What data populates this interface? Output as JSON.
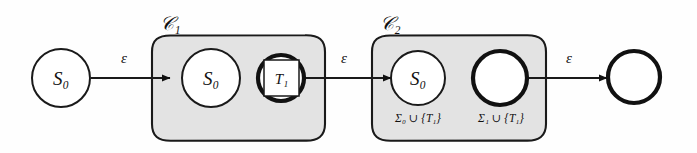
{
  "diagram": {
    "background_color": "#fefefe",
    "group_fill_color": "#e3e3e3",
    "stroke_color": "#1a1a1a",
    "groups": [
      {
        "id": "C1",
        "label": "‒1",
        "label_script": "C",
        "label_text": "C₁"
      },
      {
        "id": "C2",
        "label": "‒2",
        "label_script": "C",
        "label_text": "C₂"
      }
    ],
    "group_labels": {
      "c1": "𝒞₁",
      "c2": "𝒞₂"
    },
    "nodes": [
      {
        "id": "n0",
        "label": "S₀",
        "style": "thin-circle",
        "group": null
      },
      {
        "id": "n1",
        "label": "S₀",
        "style": "thin-circle",
        "group": "C1"
      },
      {
        "id": "n2",
        "label": "T₁",
        "style": "thick-circle-with-square",
        "group": "C1"
      },
      {
        "id": "n3",
        "label": "S₀",
        "style": "thin-circle",
        "group": "C2"
      },
      {
        "id": "n4",
        "label": "",
        "style": "thick-circle",
        "group": "C2"
      },
      {
        "id": "n5",
        "label": "",
        "style": "thick-circle",
        "group": null
      }
    ],
    "node_labels": {
      "start_s0": "S₀",
      "c1_s0": "S₀",
      "c1_t1": "T₁",
      "c2_s0": "S₀",
      "c2_blank": "",
      "final_blank": ""
    },
    "alphabet_labels": {
      "sigma0": "Σ₀ ∪ {T₁}",
      "sigma1": "Σ₁ ∪ {T₁}"
    },
    "edges": [
      {
        "id": "e1",
        "from": "n0",
        "to": "n1",
        "label": "ε"
      },
      {
        "id": "e2",
        "from": "n2",
        "to": "n3",
        "label": "ε"
      },
      {
        "id": "e3",
        "from": "n4",
        "to": "n5",
        "label": "ε"
      }
    ],
    "edge_labels": {
      "e1": "ε",
      "e2": "ε",
      "e3": "ε"
    }
  }
}
